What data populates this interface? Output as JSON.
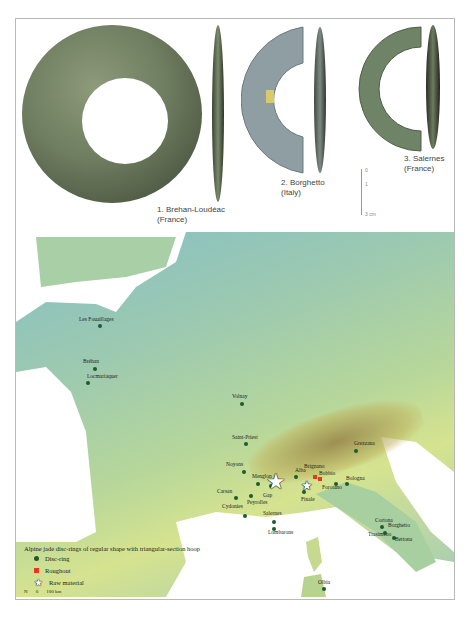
{
  "figure": {
    "objects": [
      {
        "number": "1.",
        "site": "Brehan-Loudéac",
        "country": "(France)"
      },
      {
        "number": "2.",
        "site": "Borghetto",
        "country": "(Italy)"
      },
      {
        "number": "3.",
        "site": "Salernes",
        "country": "(France)"
      }
    ],
    "scale_bar": {
      "ticks": [
        "0",
        "1",
        "3 cm"
      ]
    },
    "object_tag": "344"
  },
  "map": {
    "sites": [
      {
        "name": "Les Fouaillages",
        "x": 53,
        "y": 73,
        "type": "disc-ring"
      },
      {
        "name": "Bréhan",
        "x": 63,
        "y": 115,
        "type": "disc-ring"
      },
      {
        "name": "Locmariaquer",
        "x": 57,
        "y": 129,
        "type": "disc-ring"
      },
      {
        "name": "Volnay",
        "x": 212,
        "y": 150,
        "type": "disc-ring"
      },
      {
        "name": "Saint-Priest",
        "x": 214,
        "y": 191,
        "type": "disc-ring"
      },
      {
        "name": "Noyons",
        "x": 212,
        "y": 218,
        "type": "disc-ring"
      },
      {
        "name": "Menglon",
        "x": 228,
        "y": 231,
        "type": "disc-ring"
      },
      {
        "name": "Gap",
        "x": 239,
        "y": 240,
        "type": "disc-ring"
      },
      {
        "name": "Carsan",
        "x": 207,
        "y": 254,
        "type": "disc-ring"
      },
      {
        "name": "Peyrolles",
        "x": 230,
        "y": 252,
        "type": "disc-ring"
      },
      {
        "name": "Cydonies",
        "x": 215,
        "y": 265,
        "type": "disc-ring"
      },
      {
        "name": "Salernes",
        "x": 243,
        "y": 266,
        "type": "disc-ring"
      },
      {
        "name": "Lombarons",
        "x": 244,
        "y": 275,
        "type": "disc-ring"
      },
      {
        "name": "Alba",
        "x": 278,
        "y": 236,
        "type": "disc-ring"
      },
      {
        "name": "Brignano",
        "x": 287,
        "y": 227,
        "type": "roughout"
      },
      {
        "name": "Bobbio",
        "x": 298,
        "y": 227,
        "type": "disc-ring"
      },
      {
        "name": "Forotano",
        "x": 313,
        "y": 243,
        "type": "disc-ring"
      },
      {
        "name": "Bologna",
        "x": 322,
        "y": 243,
        "type": "disc-ring"
      },
      {
        "name": "Grezzana",
        "x": 345,
        "y": 210,
        "type": "disc-ring"
      },
      {
        "name": "Finale",
        "x": 285,
        "y": 247,
        "type": "disc-ring"
      },
      {
        "name": "Cortona",
        "x": 371,
        "y": 288,
        "type": "disc-ring"
      },
      {
        "name": "Trasimeno",
        "x": 373,
        "y": 292,
        "type": "disc-ring"
      },
      {
        "name": "Borghetto",
        "x": 384,
        "y": 287,
        "type": "disc-ring"
      },
      {
        "name": "Bettona",
        "x": 380,
        "y": 296,
        "type": "disc-ring"
      },
      {
        "name": "Olbia",
        "x": 308,
        "y": 380,
        "type": "disc-ring"
      }
    ],
    "roughouts": [
      {
        "x": 289,
        "y": 227
      },
      {
        "x": 295,
        "y": 229
      }
    ],
    "raw_material": [
      {
        "x": 260,
        "y": 233,
        "size": "large"
      },
      {
        "x": 292,
        "y": 236,
        "size": "small"
      }
    ],
    "legend": {
      "title": "Alpine jade disc-rings of regular shape with triangular-section hoop",
      "items": [
        {
          "symbol": "dot",
          "label": "Disc-ring",
          "color": "#1f5a2c"
        },
        {
          "symbol": "square",
          "label": "Roughout",
          "color": "#e03a1f"
        },
        {
          "symbol": "star",
          "label": "Raw material"
        }
      ],
      "north": "N",
      "scale": {
        "zero": "0",
        "label": "100 km"
      }
    }
  }
}
